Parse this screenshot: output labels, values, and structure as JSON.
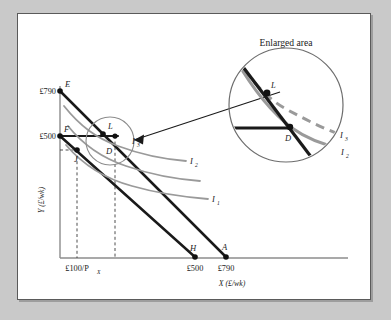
{
  "figure": {
    "inset_title": "Enlarged area",
    "axes": {
      "y_label": "Y (£/wk)",
      "x_label": "X (£/wk)",
      "y_ticks": [
        {
          "label": "£790",
          "value": 790
        },
        {
          "label": "£500",
          "value": 500
        }
      ],
      "x_ticks": [
        {
          "label": "£100/P",
          "sub": "X",
          "value": 100
        },
        {
          "label": "£500",
          "value": 500
        },
        {
          "label": "£790",
          "value": 790
        }
      ]
    },
    "points": [
      {
        "name": "E",
        "label": "E"
      },
      {
        "name": "F",
        "label": "F"
      },
      {
        "name": "L",
        "label": "L"
      },
      {
        "name": "D",
        "label": "D"
      },
      {
        "name": "J",
        "label": "J"
      },
      {
        "name": "H",
        "label": "H"
      },
      {
        "name": "A",
        "label": "A"
      }
    ],
    "curves": [
      {
        "name": "indifference-curve-1",
        "label": "I",
        "sub": "1"
      },
      {
        "name": "indifference-curve-2",
        "label": "I",
        "sub": "2"
      },
      {
        "name": "indifference-curve-3",
        "label": "I",
        "sub": "3"
      }
    ],
    "inset_curves": [
      {
        "name": "inset-indifference-curve-3",
        "label": "I",
        "sub": "3"
      },
      {
        "name": "inset-indifference-curve-2",
        "label": "I",
        "sub": "2"
      }
    ],
    "inset_points": [
      {
        "name": "L",
        "label": "L"
      },
      {
        "name": "D",
        "label": "D"
      }
    ],
    "colors": {
      "line_dark": "#1a1a1a",
      "curve_gray": "#9a9a9a",
      "axis_gray": "#8c8c8c",
      "panel_bg": "#ffffff",
      "page_bg": "#c9c9c9",
      "frame": "#5a5a5a"
    }
  }
}
